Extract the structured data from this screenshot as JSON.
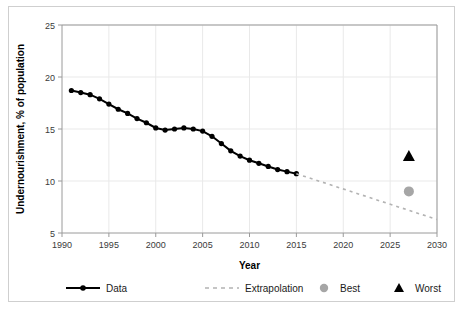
{
  "figure": {
    "background": "#ffffff",
    "border_color": "#cfcfcf"
  },
  "axis": {
    "x_title": "Year",
    "y_title": "Undernourishment, % of population",
    "x_ticks": [
      "1990",
      "1995",
      "2000",
      "2005",
      "2010",
      "2015",
      "2020",
      "2025",
      "2030"
    ],
    "y_ticks": [
      "5",
      "10",
      "15",
      "20",
      "25"
    ]
  },
  "legend": {
    "items": [
      {
        "label": "Data",
        "marker": "line-with-dot",
        "color": "#000000"
      },
      {
        "label": "Extrapolation",
        "marker": "dashed-line",
        "color": "#b3b3b3"
      },
      {
        "label": "Best",
        "marker": "circle",
        "color": "#a6a6a6"
      },
      {
        "label": "Worst",
        "marker": "triangle",
        "color": "#000000"
      }
    ]
  },
  "chart_data": {
    "type": "line",
    "title": "",
    "xlabel": "Year",
    "ylabel": "Undernourishment, % of population",
    "xlim": [
      1990,
      2030
    ],
    "ylim": [
      5,
      25
    ],
    "xticks": [
      1990,
      1995,
      2000,
      2005,
      2010,
      2015,
      2020,
      2025,
      2030
    ],
    "yticks": [
      5,
      10,
      15,
      20,
      25
    ],
    "grid": true,
    "legend_position": "bottom",
    "series": [
      {
        "name": "Data",
        "type": "line",
        "style": "solid",
        "color": "#000000",
        "marker": "circle",
        "x": [
          1991,
          1992,
          1993,
          1994,
          1995,
          1996,
          1997,
          1998,
          1999,
          2000,
          2001,
          2002,
          2003,
          2004,
          2005,
          2006,
          2007,
          2008,
          2009,
          2010,
          2011,
          2012,
          2013,
          2014,
          2015
        ],
        "values": [
          18.7,
          18.5,
          18.3,
          17.9,
          17.4,
          16.9,
          16.5,
          16.0,
          15.6,
          15.1,
          14.9,
          15.0,
          15.1,
          15.0,
          14.8,
          14.3,
          13.6,
          12.9,
          12.4,
          12.0,
          11.7,
          11.4,
          11.1,
          10.9,
          10.7
        ]
      },
      {
        "name": "Extrapolation",
        "type": "line",
        "style": "dashed",
        "color": "#b3b3b3",
        "marker": "none",
        "x": [
          2015,
          2030
        ],
        "values": [
          10.7,
          6.3
        ]
      },
      {
        "name": "Best",
        "type": "scatter",
        "color": "#a6a6a6",
        "marker": "circle",
        "x": [
          2027
        ],
        "values": [
          9.0
        ]
      },
      {
        "name": "Worst",
        "type": "scatter",
        "color": "#000000",
        "marker": "triangle",
        "x": [
          2027
        ],
        "values": [
          12.4
        ]
      }
    ]
  }
}
